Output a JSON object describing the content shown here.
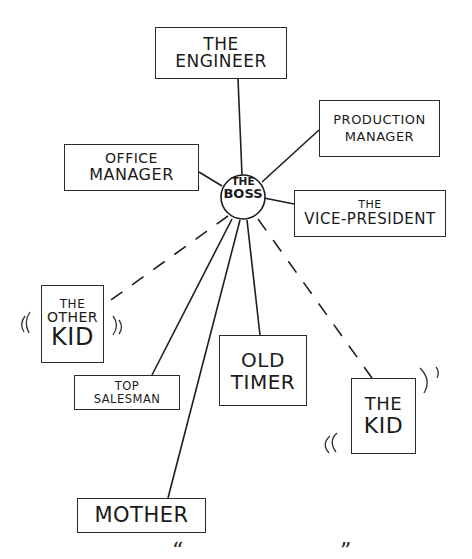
{
  "diagram": {
    "center": {
      "line1": "THE",
      "line2": "BOSS"
    },
    "nodes": [
      {
        "id": "engineer",
        "line1": "THE",
        "line2": "ENGINEER",
        "link": "solid"
      },
      {
        "id": "production-manager",
        "line1": "PRODUCTION",
        "line2": "MANAGER",
        "link": "solid"
      },
      {
        "id": "office-manager",
        "line1": "OFFICE",
        "line2": "MANAGER",
        "link": "solid"
      },
      {
        "id": "vice-president",
        "line1": "THE",
        "line2": "VICE-PRESIDENT",
        "link": "solid"
      },
      {
        "id": "other-kid",
        "line1": "THE",
        "line2": "OTHER",
        "line3": "KID",
        "link": "dashed"
      },
      {
        "id": "top-salesman",
        "line1": "TOP",
        "line2": "SALESMAN",
        "link": "solid"
      },
      {
        "id": "old-timer",
        "line1": "OLD",
        "line2": "TIMER",
        "link": "solid"
      },
      {
        "id": "the-kid",
        "line1": "THE",
        "line2": "KID",
        "link": "dashed"
      },
      {
        "id": "mother",
        "line1": "MOTHER",
        "link": "solid"
      }
    ],
    "caption": {
      "open_quote": "“",
      "close_quote": "”"
    }
  }
}
